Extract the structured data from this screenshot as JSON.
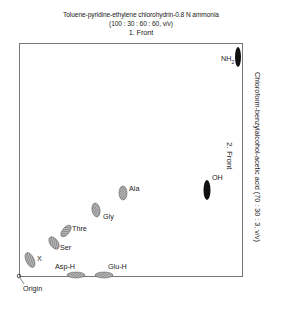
{
  "header": {
    "solvent1": "Toluene-pyridine-ethylene chlorohydrin-0.8 N ammonia",
    "ratio1": "(100 : 30 : 60 : 60, v/v)",
    "front1": "1. Front"
  },
  "side": {
    "solvent2": "Chloroform-benzylalcohol-acetic acid (70 : 30 : 3, v/v)",
    "front2": "2. Front"
  },
  "spots": {
    "nh2": "NH",
    "nh2_sub": "2",
    "oh": "OH",
    "ala": "Ala",
    "gly": "Gly",
    "thre": "Thre",
    "ser": "Ser",
    "x": "X",
    "asp": "Asp-H",
    "glu": "Glu-H"
  },
  "origin": "Origin"
}
